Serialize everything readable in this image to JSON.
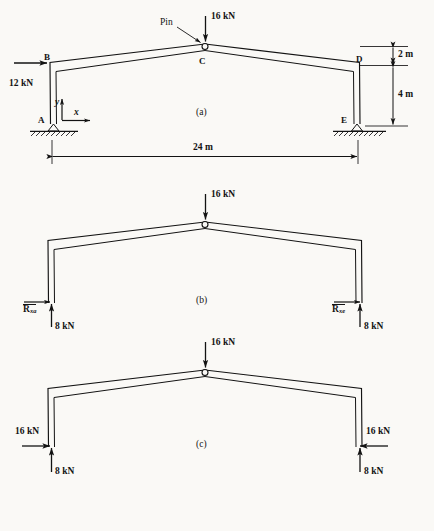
{
  "figure": {
    "type": "structural-frame-free-body-diagrams",
    "panels": [
      {
        "id": "a",
        "caption": "(a)",
        "description": "Pin-connected gable frame with applied loads and dimensions",
        "joints": [
          {
            "label": "A",
            "role": "pinned-support-left"
          },
          {
            "label": "B",
            "role": "left-knee"
          },
          {
            "label": "C",
            "role": "apex-pin"
          },
          {
            "label": "D",
            "role": "right-knee"
          },
          {
            "label": "E",
            "role": "pinned-support-right"
          }
        ],
        "annotations": {
          "pin_callout": "Pin",
          "axis_x": "x",
          "axis_y": "y"
        },
        "loads": [
          {
            "name": "apex-load",
            "value": "16 kN",
            "direction": "down",
            "at": "C"
          },
          {
            "name": "lateral-load",
            "value": "12 kN",
            "direction": "right",
            "at": "B"
          }
        ],
        "dimensions": [
          {
            "name": "rise-upper",
            "value": "2 m",
            "orientation": "vertical"
          },
          {
            "name": "column-height",
            "value": "4 m",
            "orientation": "vertical"
          },
          {
            "name": "span",
            "value": "24 m",
            "orientation": "horizontal"
          }
        ]
      },
      {
        "id": "b",
        "caption": "(b)",
        "description": "Free-body diagram with symbolic horizontal reactions",
        "loads": [
          {
            "name": "apex-load",
            "value": "16 kN",
            "direction": "down"
          }
        ],
        "reactions": [
          {
            "name": "left-horizontal-reaction",
            "symbol": "R",
            "subscript": "xa",
            "direction": "right"
          },
          {
            "name": "left-vertical-reaction",
            "value": "8 kN",
            "direction": "up"
          },
          {
            "name": "right-horizontal-reaction",
            "symbol": "R",
            "subscript": "xe",
            "direction": "right"
          },
          {
            "name": "right-vertical-reaction",
            "value": "8 kN",
            "direction": "up"
          }
        ]
      },
      {
        "id": "c",
        "caption": "(c)",
        "description": "Free-body diagram with computed reaction magnitudes",
        "loads": [
          {
            "name": "apex-load",
            "value": "16 kN",
            "direction": "down"
          }
        ],
        "reactions": [
          {
            "name": "left-horizontal-reaction",
            "value": "16 kN",
            "direction": "right"
          },
          {
            "name": "left-vertical-reaction",
            "value": "8 kN",
            "direction": "up"
          },
          {
            "name": "right-horizontal-reaction",
            "value": "16 kN",
            "direction": "left"
          },
          {
            "name": "right-vertical-reaction",
            "value": "8 kN",
            "direction": "up"
          }
        ]
      }
    ]
  },
  "labels": {
    "pin": "Pin",
    "load_16": "16 kN",
    "load_12": "12 kN",
    "axis_x": "x",
    "axis_y": "y",
    "joint_a": "A",
    "joint_b": "B",
    "joint_c": "C",
    "joint_d": "D",
    "joint_e": "E",
    "dim_2m": "2 m",
    "dim_4m": "4 m",
    "dim_24m": "24 m",
    "caption_a": "(a)",
    "caption_b": "(b)",
    "caption_c": "(c)",
    "react_R": "R",
    "react_sub_xa": "xa",
    "react_sub_xe": "xe",
    "react_8": "8 kN",
    "react_16": "16 kN"
  },
  "colors": {
    "ink": "#131313",
    "paper": "#faf9f6"
  }
}
